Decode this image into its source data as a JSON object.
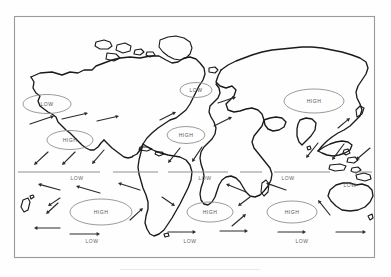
{
  "figure": {
    "kind": "world-map-diagram",
    "frame": {
      "x": 14,
      "y": 16,
      "width": 361,
      "height": 242,
      "stroke": "#9a9a9a"
    },
    "colors": {
      "coastline": "#1a1a1a",
      "ellipse": "#8e8e8e",
      "label_text": "#555555",
      "arrow": "#2a2a2a",
      "frame": "#9a9a9a",
      "background": "#ffffff"
    }
  },
  "equator": {
    "label": "equator-line",
    "y": 172,
    "segments": [
      {
        "x1": 18,
        "x2": 100
      },
      {
        "x1": 113,
        "x2": 158
      },
      {
        "x1": 168,
        "x2": 228
      },
      {
        "x1": 240,
        "x2": 262
      },
      {
        "x1": 274,
        "x2": 330
      },
      {
        "x1": 352,
        "x2": 372
      }
    ]
  },
  "pressure_cells": [
    {
      "id": "low-north-pacific",
      "label": "LOW",
      "cx": 47,
      "cy": 104,
      "rx": 24,
      "ry": 9.5
    },
    {
      "id": "low-north-atlantic",
      "label": "LOW",
      "cx": 196,
      "cy": 90,
      "rx": 16,
      "ry": 7.5
    },
    {
      "id": "high-asia",
      "label": "HIGH",
      "cx": 314,
      "cy": 101,
      "rx": 30,
      "ry": 12
    },
    {
      "id": "high-north-pacific",
      "label": "HIGH",
      "cx": 70,
      "cy": 140,
      "rx": 23,
      "ry": 9.5
    },
    {
      "id": "high-north-atlantic",
      "label": "HIGH",
      "cx": 186,
      "cy": 135,
      "rx": 19,
      "ry": 8.5
    },
    {
      "id": "high-south-pacific",
      "label": "HIGH",
      "cx": 101,
      "cy": 212,
      "rx": 31,
      "ry": 13
    },
    {
      "id": "high-south-atlantic",
      "label": "HIGH",
      "cx": 210,
      "cy": 212,
      "rx": 23,
      "ry": 10
    },
    {
      "id": "high-indian-ocean",
      "label": "HIGH",
      "cx": 292,
      "cy": 212,
      "rx": 25,
      "ry": 11
    }
  ],
  "pressure_text_labels": [
    {
      "id": "low-equator-pacific",
      "label": "LOW",
      "x": 77,
      "y": 180
    },
    {
      "id": "low-equator-atlantic",
      "label": "LOW",
      "x": 205,
      "y": 180
    },
    {
      "id": "low-equator-indian",
      "label": "LOW",
      "x": 288,
      "y": 180
    },
    {
      "id": "low-australia",
      "label": "LOW",
      "x": 350,
      "y": 187
    },
    {
      "id": "low-south-pacific",
      "label": "LOW",
      "x": 92,
      "y": 243
    },
    {
      "id": "low-south-atlantic",
      "label": "LOW",
      "x": 190,
      "y": 243
    },
    {
      "id": "low-south-indian",
      "label": "LOW",
      "x": 302,
      "y": 243
    }
  ],
  "wind_arrows": [
    {
      "id": "arrow-np-1",
      "x1": 30,
      "y1": 124,
      "x2": 54,
      "y2": 116
    },
    {
      "id": "arrow-np-2",
      "x1": 62,
      "y1": 119,
      "x2": 88,
      "y2": 113
    },
    {
      "id": "arrow-np-3",
      "x1": 97,
      "y1": 121,
      "x2": 119,
      "y2": 116
    },
    {
      "id": "arrow-na-1",
      "x1": 160,
      "y1": 120,
      "x2": 176,
      "y2": 112
    },
    {
      "id": "arrow-na-2",
      "x1": 214,
      "y1": 126,
      "x2": 232,
      "y2": 117
    },
    {
      "id": "arrow-na-3",
      "x1": 218,
      "y1": 103,
      "x2": 236,
      "y2": 97
    },
    {
      "id": "arrow-asia-1",
      "x1": 338,
      "y1": 128,
      "x2": 350,
      "y2": 118
    },
    {
      "id": "arrow-np-out1",
      "x1": 48,
      "y1": 152,
      "x2": 34,
      "y2": 165
    },
    {
      "id": "arrow-np-out2",
      "x1": 75,
      "y1": 152,
      "x2": 62,
      "y2": 165
    },
    {
      "id": "arrow-np-out3",
      "x1": 104,
      "y1": 150,
      "x2": 92,
      "y2": 164
    },
    {
      "id": "arrow-na-out1",
      "x1": 180,
      "y1": 148,
      "x2": 168,
      "y2": 163
    },
    {
      "id": "arrow-na-out2",
      "x1": 202,
      "y1": 147,
      "x2": 192,
      "y2": 162
    },
    {
      "id": "arrow-as-out1",
      "x1": 318,
      "y1": 143,
      "x2": 306,
      "y2": 158
    },
    {
      "id": "arrow-as-out2",
      "x1": 344,
      "y1": 144,
      "x2": 332,
      "y2": 160
    },
    {
      "id": "arrow-ne-trade1",
      "x1": 60,
      "y1": 190,
      "x2": 38,
      "y2": 184
    },
    {
      "id": "arrow-ne-trade2",
      "x1": 100,
      "y1": 193,
      "x2": 76,
      "y2": 186
    },
    {
      "id": "arrow-ne-trade3",
      "x1": 140,
      "y1": 190,
      "x2": 118,
      "y2": 183
    },
    {
      "id": "arrow-ne-trade4",
      "x1": 246,
      "y1": 192,
      "x2": 226,
      "y2": 184
    },
    {
      "id": "arrow-ne-trade5",
      "x1": 286,
      "y1": 190,
      "x2": 266,
      "y2": 183
    },
    {
      "id": "arrow-se-trade1",
      "x1": 60,
      "y1": 198,
      "x2": 48,
      "y2": 206
    },
    {
      "id": "arrow-se-trade2",
      "x1": 162,
      "y1": 197,
      "x2": 175,
      "y2": 206
    },
    {
      "id": "arrow-se-trade3",
      "x1": 250,
      "y1": 197,
      "x2": 238,
      "y2": 206
    },
    {
      "id": "arrow-se-ret1",
      "x1": 130,
      "y1": 220,
      "x2": 143,
      "y2": 208
    },
    {
      "id": "arrow-se-ret2",
      "x1": 232,
      "y1": 226,
      "x2": 246,
      "y2": 214
    },
    {
      "id": "arrow-sh-west1",
      "x1": 70,
      "y1": 234,
      "x2": 100,
      "y2": 234
    },
    {
      "id": "arrow-sh-west2",
      "x1": 168,
      "y1": 232,
      "x2": 196,
      "y2": 232
    },
    {
      "id": "arrow-sh-west3",
      "x1": 220,
      "y1": 231,
      "x2": 248,
      "y2": 231
    },
    {
      "id": "arrow-sh-west4",
      "x1": 278,
      "y1": 232,
      "x2": 306,
      "y2": 232
    },
    {
      "id": "arrow-sh-west5",
      "x1": 336,
      "y1": 232,
      "x2": 366,
      "y2": 232
    },
    {
      "id": "arrow-sw-left1",
      "x1": 60,
      "y1": 228,
      "x2": 34,
      "y2": 228
    },
    {
      "id": "arrow-aus-1",
      "x1": 330,
      "y1": 215,
      "x2": 318,
      "y2": 200
    },
    {
      "id": "arrow-aus-2",
      "x1": 370,
      "y1": 148,
      "x2": 356,
      "y2": 160
    },
    {
      "id": "arrow-pac-sw1",
      "x1": 58,
      "y1": 203,
      "x2": 46,
      "y2": 214
    }
  ]
}
